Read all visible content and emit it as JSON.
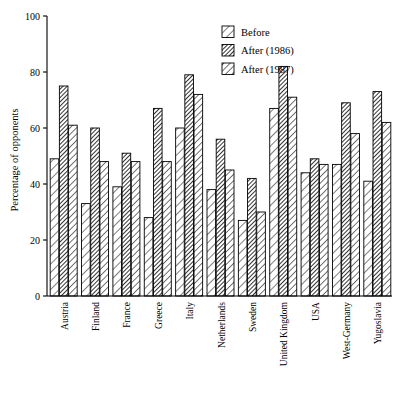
{
  "chart_data": {
    "type": "bar",
    "title": "",
    "xlabel": "",
    "ylabel": "Percentage of opponents",
    "ylim": [
      0,
      100
    ],
    "yticks": [
      0,
      20,
      40,
      60,
      80,
      100
    ],
    "grid": false,
    "legend_position": "top-right",
    "categories": [
      "Austria",
      "Finland",
      "France",
      "Greece",
      "Italy",
      "Netherlands",
      "Sweden",
      "United Kingdom",
      "USA",
      "West-Germany",
      "Yugoslavia"
    ],
    "series": [
      {
        "name": "Before",
        "pattern": "diagonal-hatch-light",
        "values": [
          49,
          33,
          39,
          28,
          60,
          38,
          27,
          67,
          44,
          47,
          41
        ]
      },
      {
        "name": "After (1986)",
        "pattern": "diagonal-hatch-dark",
        "values": [
          75,
          60,
          51,
          67,
          79,
          56,
          42,
          82,
          49,
          69,
          73
        ]
      },
      {
        "name": "After (1987)",
        "pattern": "diagonal-hatch-medium",
        "values": [
          61,
          48,
          48,
          48,
          72,
          45,
          30,
          71,
          47,
          58,
          62
        ]
      }
    ]
  },
  "legend": {
    "items": [
      {
        "label": "Before"
      },
      {
        "label": "After (1986)"
      },
      {
        "label": "After (1987)"
      }
    ]
  },
  "axis": {
    "y_label": "Percentage of opponents",
    "y_ticks": [
      "0",
      "20",
      "40",
      "60",
      "80",
      "100"
    ]
  }
}
